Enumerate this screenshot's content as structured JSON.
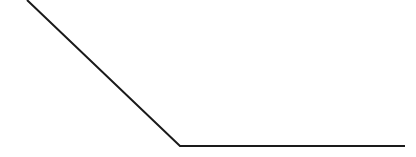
{
  "canvas": {
    "width": 416,
    "height": 157,
    "background_color": "#ffffff"
  },
  "figure": {
    "name": "angled-polyline",
    "stroke_color": "#1a1a1a",
    "stroke_width": 2
  },
  "chart_data": {
    "type": "line",
    "title": "",
    "subtitle": "",
    "xlabel": "",
    "ylabel": "",
    "grid": false,
    "legend": null,
    "axis_visible": false,
    "tick_labels_x": [],
    "tick_labels_y": [],
    "xlim": [
      0,
      416
    ],
    "ylim": [
      157,
      0
    ],
    "series": [
      {
        "name": "profile",
        "color": "#1a1a1a",
        "width": 2,
        "points": [
          {
            "x": 27,
            "y": 0
          },
          {
            "x": 180,
            "y": 146
          },
          {
            "x": 405,
            "y": 146
          }
        ]
      }
    ],
    "annotations": [],
    "segments": [
      {
        "name": "descending-diagonal",
        "from": {
          "x": 27,
          "y": 0
        },
        "to": {
          "x": 180,
          "y": 146
        },
        "slope": 0.954
      },
      {
        "name": "flat-baseline",
        "from": {
          "x": 180,
          "y": 146
        },
        "to": {
          "x": 405,
          "y": 146
        },
        "slope": 0
      }
    ],
    "vertex": {
      "x": 180,
      "y": 146
    }
  }
}
